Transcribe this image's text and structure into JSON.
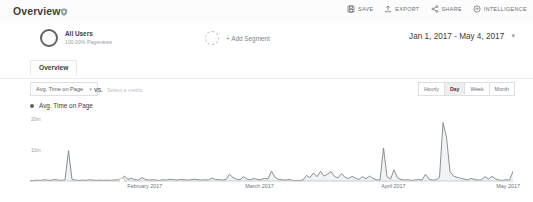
{
  "header": {
    "title": "Overview",
    "badge_icon": "shield-icon",
    "toolbar": [
      {
        "label": "SAVE",
        "icon": "save-icon"
      },
      {
        "label": "EXPORT",
        "icon": "export-icon"
      },
      {
        "label": "SHARE",
        "icon": "share-icon"
      },
      {
        "label": "INTELLIGENCE",
        "icon": "intelligence-icon"
      }
    ]
  },
  "segment_bar": {
    "all_users": {
      "name": "All Users",
      "sub": "100.00% Pageviews"
    },
    "add_segment_label": "+ Add Segment",
    "date_range": "Jan 1, 2017 - May 4, 2017",
    "date_caret": "▾"
  },
  "tabs": [
    {
      "label": "Overview",
      "active": true
    }
  ],
  "metric_row": {
    "primary_metric": "Avg. Time on Page",
    "primary_caret": "▾",
    "vs_label": "VS.",
    "secondary_placeholder": "Select a metric",
    "granularity": [
      {
        "label": "Hourly",
        "active": false
      },
      {
        "label": "Day",
        "active": true
      },
      {
        "label": "Week",
        "active": false
      },
      {
        "label": "Month",
        "active": false
      }
    ]
  },
  "colors": {
    "line": "#7e8387",
    "fill": "#f2f3f4",
    "axis": "#bdc1c6",
    "text": "#3c4043",
    "muted": "#9aa0a6",
    "header_bg": "#fcfcfc"
  },
  "chart_data": {
    "type": "line",
    "title": "Avg. Time on Page",
    "legend": [
      "Avg. Time on Page"
    ],
    "legend_position": "top-left",
    "xlabel": "",
    "ylabel": "",
    "grid": false,
    "ylim": [
      0,
      22
    ],
    "yticks": [
      10,
      20
    ],
    "ytick_labels": [
      "10m",
      "20m"
    ],
    "xtick_labels": [
      "February 2017",
      "March 2017",
      "April 2017",
      "May 2017"
    ],
    "xtick_positions": [
      0.2376,
      0.4752,
      0.7525,
      0.9901
    ],
    "x_start": "2017-01-01",
    "x_end": "2017-05-04",
    "series": [
      {
        "name": "Avg. Time on Page",
        "unit": "minutes",
        "values": [
          0.2,
          0.1,
          0.3,
          0.2,
          0.4,
          0.3,
          0.2,
          0.5,
          0.3,
          0.2,
          0.4,
          9.8,
          0.5,
          0.3,
          0.2,
          0.3,
          0.2,
          0.4,
          0.3,
          0.2,
          0.3,
          0.2,
          0.3,
          0.2,
          0.3,
          0.4,
          0.3,
          1.6,
          0.5,
          0.9,
          0.4,
          0.3,
          1.1,
          0.5,
          0.3,
          0.4,
          0.3,
          0.2,
          0.4,
          0.3,
          0.6,
          0.4,
          0.3,
          0.5,
          0.4,
          0.3,
          0.4,
          0.6,
          0.4,
          0.3,
          0.4,
          0.3,
          1.0,
          0.5,
          0.4,
          0.3,
          0.5,
          2.2,
          1.1,
          0.6,
          0.4,
          1.4,
          0.6,
          0.4,
          0.8,
          0.5,
          0.4,
          0.9,
          0.6,
          3.2,
          1.2,
          0.5,
          0.4,
          0.3,
          0.5,
          0.2,
          0.1,
          0.2,
          0.3,
          1.8,
          1.1,
          2.6,
          1.4,
          3.1,
          1.6,
          2.2,
          3.0,
          1.5,
          1.0,
          2.4,
          1.2,
          0.8,
          1.5,
          0.9,
          0.5,
          1.4,
          0.7,
          1.6,
          0.8,
          0.4,
          0.3,
          10.7,
          1.4,
          0.6,
          3.6,
          1.0,
          0.5,
          0.3,
          0.4,
          0.2,
          0.3,
          0.5,
          0.3,
          2.2,
          0.6,
          0.3,
          0.4,
          1.1,
          18.9,
          14.2,
          3.0,
          1.6,
          1.2,
          0.9,
          0.6,
          0.4,
          0.8,
          0.5,
          0.3,
          0.4,
          1.4,
          0.6,
          1.5,
          0.7,
          0.3,
          0.2,
          0.4,
          0.3,
          3.1
        ],
        "peaks": [
          {
            "label": "early January spike",
            "value": 9.8
          },
          {
            "label": "late March spike",
            "value": 10.7
          },
          {
            "label": "mid April spike",
            "value": 18.9
          }
        ]
      }
    ]
  }
}
